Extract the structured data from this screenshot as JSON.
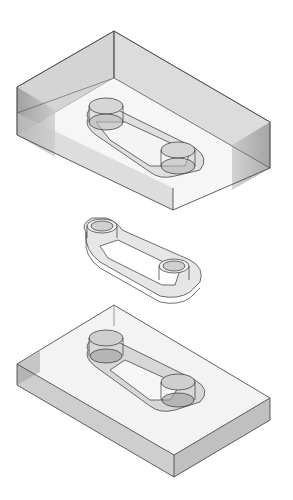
{
  "figure": {
    "background": "#ffffff",
    "colors": {
      "edge": "#3a3a3a",
      "face_light": "#d9d9d9",
      "face_mid": "#b8b8b8",
      "face_dark": "#8f8f8f",
      "part_fill": "#e8e8e8",
      "part_shade": "#a0a0a0"
    },
    "components": [
      {
        "name": "upper-mold-block"
      },
      {
        "name": "molded-part"
      },
      {
        "name": "lower-mold-block"
      }
    ]
  }
}
